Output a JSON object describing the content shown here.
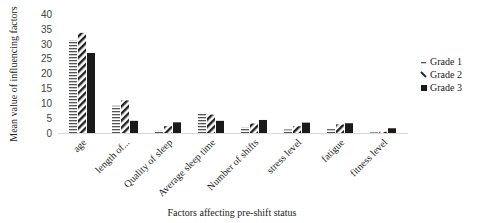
{
  "chart_data": {
    "type": "bar",
    "title": "",
    "xlabel": "Factors affecting pre-shift status",
    "ylabel": "Mean value of influencing factors",
    "ylim": [
      0,
      40
    ],
    "yticks": [
      0,
      5,
      10,
      15,
      20,
      25,
      30,
      35,
      40
    ],
    "grid": false,
    "legend_position": "right",
    "categories": [
      "age",
      "length of...",
      "Quality of sleep",
      "Average sleep time",
      "Number of shifts",
      "stress level",
      "fatigue",
      "fitness level"
    ],
    "series": [
      {
        "name": "Grade 1",
        "pattern": "horizontal-lines",
        "color": "#555555",
        "values": [
          31.3,
          9.2,
          0.8,
          6.8,
          1.9,
          1.2,
          1.3,
          0.2
        ]
      },
      {
        "name": "Grade 2",
        "pattern": "diagonal-stripes",
        "color": "#222222",
        "values": [
          33.8,
          11.0,
          2.3,
          6.2,
          3.2,
          2.3,
          2.9,
          0.4
        ]
      },
      {
        "name": "Grade 3",
        "pattern": "solid",
        "color": "#1a1a1a",
        "values": [
          27.0,
          4.1,
          3.6,
          4.1,
          4.4,
          3.5,
          3.3,
          1.6
        ]
      }
    ]
  }
}
